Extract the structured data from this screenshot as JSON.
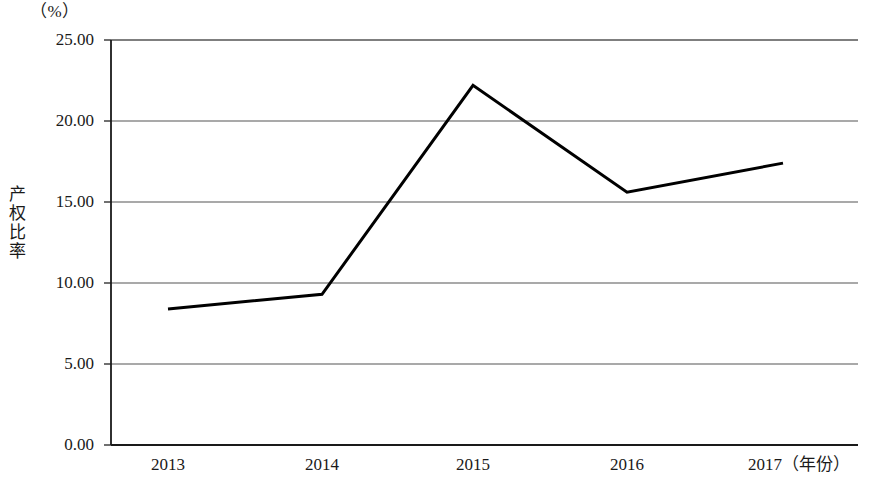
{
  "chart_data": {
    "type": "line",
    "title": "",
    "unit_label": "（%）",
    "xlabel": "（年份）",
    "ylabel": "产权比率",
    "categories": [
      "2013",
      "2014",
      "2015",
      "2016",
      "2017"
    ],
    "x_tick_labels": [
      "2013",
      "2014",
      "2015",
      "2016",
      "2017（年份）"
    ],
    "y_tick_labels": [
      "25.00",
      "20.00",
      "15.00",
      "10.00",
      "5.00",
      "0.00"
    ],
    "y_ticks": [
      25.0,
      20.0,
      15.0,
      10.0,
      5.0,
      0.0
    ],
    "ylim": [
      0.0,
      25.0
    ],
    "values": [
      8.4,
      9.3,
      22.2,
      15.6,
      17.4
    ],
    "series": [
      {
        "name": "产权比率",
        "values": [
          8.4,
          9.3,
          22.2,
          15.6,
          17.4
        ],
        "color": "#000000",
        "line_width": 3
      }
    ],
    "grid": {
      "horizontal": true,
      "vertical": false,
      "color": "#555555"
    },
    "legend": {
      "visible": false,
      "position": "none"
    },
    "axis": {
      "left_border": true,
      "bottom_border": true,
      "top_border": true,
      "right_border": false,
      "tick_marks": "outward-left"
    },
    "markers": "none"
  },
  "figure": {
    "background_color": "#ffffff",
    "text_color": "#1a1a1a"
  }
}
